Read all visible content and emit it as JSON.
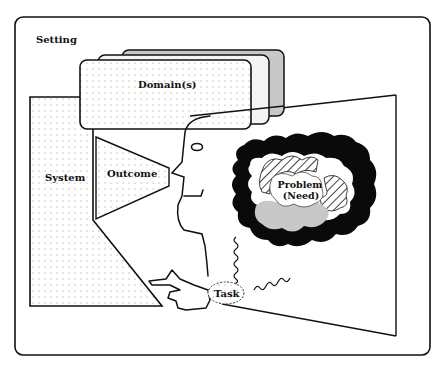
{
  "diagram": {
    "frame_label": "Setting",
    "domain_label": "Domain(s)",
    "system_label": "System",
    "outcome_label": "Outcome",
    "problem_label_line1": "Problem",
    "problem_label_line2": "(Need)",
    "task_label": "Task"
  },
  "colors": {
    "stroke": "#111111",
    "background": "#ffffff",
    "grey_fill": "#c8c8c8",
    "dot": "#9a9a9a",
    "blob_black": "#0a0a0a"
  }
}
